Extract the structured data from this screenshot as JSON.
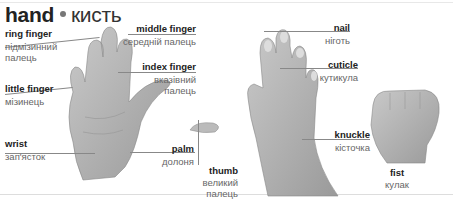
{
  "title": {
    "en": "hand",
    "uk": "кисть"
  },
  "labels": {
    "ring_finger": {
      "en": "ring finger",
      "uk1": "підмізинний",
      "uk2": "палець"
    },
    "middle_finger": {
      "en": "middle finger",
      "uk": "середній палець"
    },
    "index_finger": {
      "en": "index finger",
      "uk1": "вказівний",
      "uk2": "палець"
    },
    "little_finger": {
      "en": "little finger",
      "uk": "мізинець"
    },
    "wrist": {
      "en": "wrist",
      "uk": "зап'ясток"
    },
    "palm": {
      "en": "palm",
      "uk": "долоня"
    },
    "thumb": {
      "en": "thumb",
      "uk1": "великий",
      "uk2": "палець"
    },
    "nail": {
      "en": "nail",
      "uk": "ніготь"
    },
    "cuticle": {
      "en": "cuticle",
      "uk": "кутикула"
    },
    "knuckle": {
      "en": "knuckle",
      "uk": "кісточка"
    },
    "fist": {
      "en": "fist",
      "uk": "кулак"
    }
  }
}
